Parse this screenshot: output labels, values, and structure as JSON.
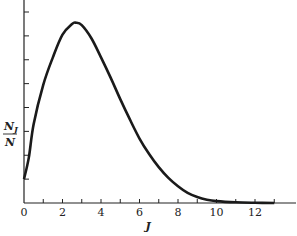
{
  "chart_data": {
    "type": "line",
    "title": "",
    "xlabel": "J",
    "ylabel": "N_J / N",
    "ylabel_numerator": "N",
    "ylabel_numerator_sub": "J",
    "ylabel_denominator": "N",
    "xlim": [
      0,
      14
    ],
    "ylim": [
      0,
      8
    ],
    "x_ticks": [
      0,
      1,
      2,
      3,
      4,
      5,
      6,
      7,
      8,
      9,
      10,
      11,
      12,
      13
    ],
    "x_tick_labels": [
      "0",
      "2",
      "4",
      "6",
      "8",
      "10",
      "12"
    ],
    "x_tick_label_values": [
      0,
      2,
      4,
      6,
      8,
      10,
      12
    ],
    "y_ticks_count": 8,
    "y_tick_labels": [],
    "grid": false,
    "legend": null,
    "series": [
      {
        "name": "N_J/N",
        "x": [
          0,
          0.25,
          0.5,
          1,
          1.5,
          2,
          2.5,
          2.7,
          3,
          3.5,
          4,
          4.5,
          5,
          5.5,
          6,
          6.5,
          7,
          7.5,
          8,
          8.5,
          9,
          9.5,
          10,
          11,
          12,
          13
        ],
        "y": [
          1.0,
          1.9,
          3.3,
          4.95,
          6.1,
          7.05,
          7.5,
          7.55,
          7.45,
          6.9,
          6.1,
          5.25,
          4.35,
          3.5,
          2.7,
          2.05,
          1.5,
          1.05,
          0.7,
          0.42,
          0.25,
          0.14,
          0.08,
          0.03,
          0.01,
          0.0
        ]
      }
    ]
  }
}
